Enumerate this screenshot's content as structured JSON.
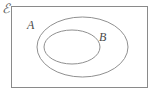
{
  "diagram": {
    "type": "euler-diagram",
    "caption": "Set B is a subset of set A, both inside universal set E",
    "background_color": "#ffffff",
    "universal_set": {
      "label": "ℰ",
      "label_name": "universal-set-symbol",
      "shape": "rectangle",
      "stroke_color": "#8a8a8a",
      "stroke_width": 1,
      "x": 11,
      "y": 6,
      "width": 137,
      "height": 82
    },
    "sets": [
      {
        "label": "A",
        "name": "set-a",
        "shape": "ellipse",
        "stroke_color": "#909090",
        "stroke_width": 1,
        "cx": 82.5,
        "cy": 47,
        "rx": 45.5,
        "ry": 30,
        "label_x": 27,
        "label_y": 19
      },
      {
        "label": "B",
        "name": "set-b",
        "shape": "ellipse",
        "stroke_color": "#909090",
        "stroke_width": 1,
        "cx": 72,
        "cy": 47,
        "rx": 28,
        "ry": 17,
        "label_x": 99,
        "label_y": 31
      }
    ],
    "relation": "B ⊂ A ⊂ ℰ"
  }
}
